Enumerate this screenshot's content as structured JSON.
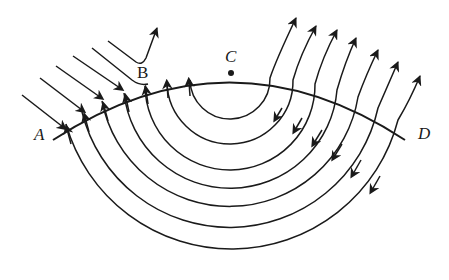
{
  "diagram": {
    "type": "field-lines-across-boundary",
    "stroke_color": "#1a1a1a",
    "background": "#ffffff",
    "boundary": {
      "name": "boundary-arc",
      "from": "A",
      "through": [
        "B",
        "C"
      ],
      "to": "D"
    },
    "labels": {
      "A": "A",
      "B": "B",
      "C": "C",
      "D": "D"
    },
    "points": {
      "A": {
        "x": 57,
        "y": 135
      },
      "B": {
        "x": 147,
        "y": 85
      },
      "C": {
        "x": 231,
        "y": 73
      },
      "D": {
        "x": 400,
        "y": 133
      }
    },
    "incoming_parallel_lines": 6,
    "semicircular_field_lines": 7,
    "outgoing_arrows_upper_right": 11
  }
}
